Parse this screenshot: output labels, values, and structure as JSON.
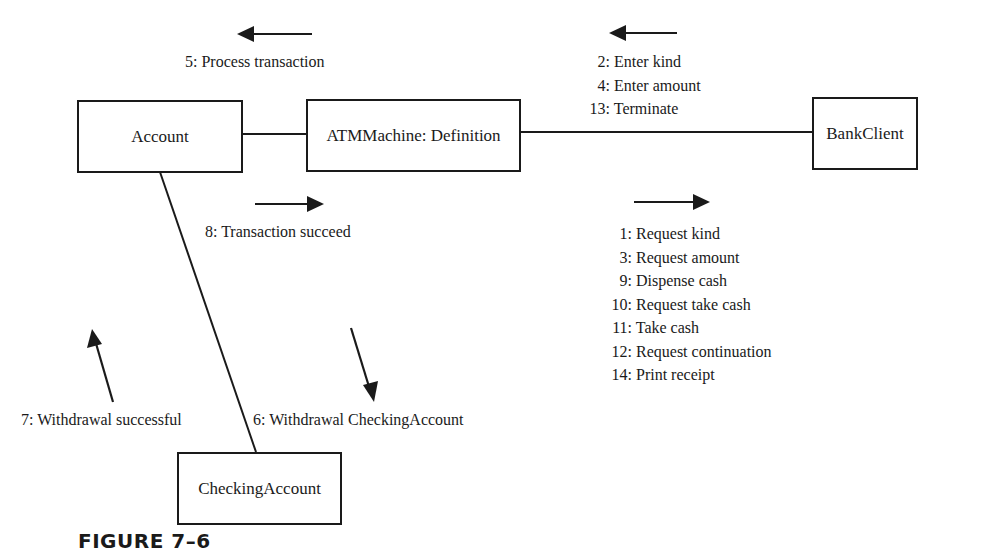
{
  "objects": {
    "account": "Account",
    "atm": "ATMMachine: Definition",
    "bank_client": "BankClient",
    "checking_account": "CheckingAccount"
  },
  "messages": {
    "atm_to_account": [
      "5: Process transaction"
    ],
    "account_to_atm": [
      "8: Transaction succeed"
    ],
    "client_to_atm": [
      {
        "num": "2:",
        "text": "Enter kind"
      },
      {
        "num": "4:",
        "text": "Enter amount"
      },
      {
        "num": "13:",
        "text": "Terminate"
      }
    ],
    "atm_to_client": [
      {
        "num": "1:",
        "text": "Request kind"
      },
      {
        "num": "3:",
        "text": "Request amount"
      },
      {
        "num": "9:",
        "text": "Dispense cash"
      },
      {
        "num": "10:",
        "text": "Request take cash"
      },
      {
        "num": "11:",
        "text": "Take cash"
      },
      {
        "num": "12:",
        "text": "Request continuation"
      },
      {
        "num": "14:",
        "text": "Print receipt"
      }
    ],
    "checking_to_account": [
      "7: Withdrawal successful"
    ],
    "account_to_checking": [
      "6: Withdrawal CheckingAccount"
    ]
  },
  "caption": "FIGURE 7–6",
  "colors": {
    "ink": "#1a1a1a",
    "background": "#ffffff"
  }
}
